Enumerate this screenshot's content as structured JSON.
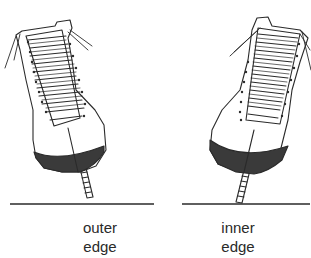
{
  "figures": [
    {
      "id": "outer",
      "label_line1": "outer",
      "label_line2": "edge"
    },
    {
      "id": "inner",
      "label_line1": "inner",
      "label_line2": "edge"
    }
  ],
  "colors": {
    "ink": "#2a2a2a",
    "background": "#ffffff",
    "edge_band": "#3a3a3a"
  }
}
